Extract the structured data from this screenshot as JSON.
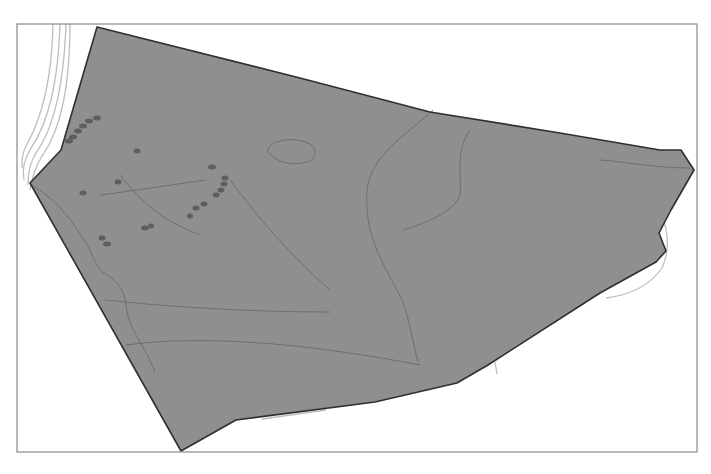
{
  "map": {
    "width": 711,
    "height": 474,
    "frame": {
      "x": 17,
      "y": 24,
      "width": 680,
      "height": 428
    },
    "colors": {
      "background": "#ffffff",
      "frame": "#8a8a8a",
      "parcel_fill": "#8f8f8f",
      "parcel_outline": "#2f2f2f",
      "contour": "#6a6a6a",
      "road": "#bdbdbd",
      "feature_dot": "#5e5e5e"
    },
    "parcel_polygon": "97,27 300,78 430,112 560,133 660,150 681,150 694,170 671,210 659,233 666,251 656,262 600,293 488,365 457,383 375,402 236,420 181,451 30,183 61,150",
    "roads": [
      "M 60,24 C 58,80 50,120 30,150 C 24,160 22,170 24,180",
      "M 66,24 C 64,80 56,125 36,153 C 30,162 28,172 28,185",
      "M 70,24 C 70,80 62,128 42,156 C 36,166 32,176 30,190",
      "M 53,24 C 52,80 42,118 26,146 C 22,154 22,160 22,168",
      "M 661,213 C 668,230 670,250 662,268 C 650,285 630,295 606,298",
      "M 262,419 L 326,410",
      "M 495,362 L 497,374"
    ],
    "contours": [
      "M 433,110 C 400,140 372,155 367,190 C 364,240 385,265 402,300 C 410,320 412,340 418,362",
      "M 470,130 C 455,150 462,175 460,195 C 455,210 430,222 403,230",
      "M 600,160 C 630,162 655,168 690,168",
      "M 31,185 C 60,200 78,230 90,250 C 95,262 98,268 102,272 C 118,280 125,292 126,305 C 128,330 145,345 155,372",
      "M 126,345 C 200,335 300,342 420,365",
      "M 105,300 C 200,310 280,312 330,312",
      "M 268,152 C 266,145 280,138 296,140 C 316,142 318,152 312,160 C 300,166 280,166 268,152 Z",
      "M 120,175 C 140,200 160,220 200,235",
      "M 230,180 C 260,220 290,255 330,290",
      "M 100,195 C 140,190 170,185 205,180"
    ],
    "feature_dots": [
      {
        "cx": 97,
        "cy": 118,
        "rx": 4,
        "ry": 2.5
      },
      {
        "cx": 89,
        "cy": 121,
        "rx": 4,
        "ry": 2.5
      },
      {
        "cx": 83,
        "cy": 126,
        "rx": 4,
        "ry": 2.5
      },
      {
        "cx": 78,
        "cy": 131,
        "rx": 4,
        "ry": 2.5
      },
      {
        "cx": 73,
        "cy": 137,
        "rx": 4,
        "ry": 2.5
      },
      {
        "cx": 69,
        "cy": 141,
        "rx": 4,
        "ry": 2.5
      },
      {
        "cx": 137,
        "cy": 151,
        "rx": 3.5,
        "ry": 2.5
      },
      {
        "cx": 118,
        "cy": 182,
        "rx": 3.5,
        "ry": 2.5
      },
      {
        "cx": 83,
        "cy": 193,
        "rx": 3.5,
        "ry": 2.5
      },
      {
        "cx": 212,
        "cy": 167,
        "rx": 4,
        "ry": 2.5
      },
      {
        "cx": 225,
        "cy": 178,
        "rx": 3.5,
        "ry": 2.5
      },
      {
        "cx": 224,
        "cy": 184,
        "rx": 3.5,
        "ry": 2.5
      },
      {
        "cx": 221,
        "cy": 190,
        "rx": 3.5,
        "ry": 2.5
      },
      {
        "cx": 216,
        "cy": 195,
        "rx": 3.5,
        "ry": 2.5
      },
      {
        "cx": 204,
        "cy": 204,
        "rx": 3.5,
        "ry": 2.5
      },
      {
        "cx": 196,
        "cy": 208,
        "rx": 3.5,
        "ry": 2.5
      },
      {
        "cx": 190,
        "cy": 216,
        "rx": 3,
        "ry": 2.5
      },
      {
        "cx": 145,
        "cy": 228,
        "rx": 4,
        "ry": 2.5
      },
      {
        "cx": 151,
        "cy": 226,
        "rx": 3,
        "ry": 2.5
      },
      {
        "cx": 102,
        "cy": 238,
        "rx": 3.5,
        "ry": 2.5
      },
      {
        "cx": 107,
        "cy": 244,
        "rx": 4,
        "ry": 2.5
      }
    ]
  }
}
